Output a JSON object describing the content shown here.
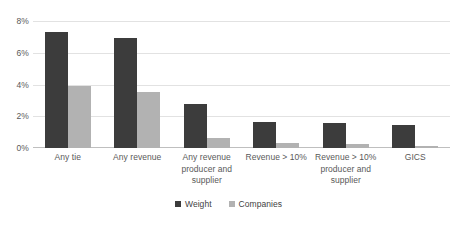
{
  "chart_data": {
    "type": "bar",
    "title": "",
    "subtitle": "",
    "xlabel": "",
    "ylabel": "",
    "grid": true,
    "legend_position": "bottom",
    "ylim": [
      0,
      8
    ],
    "ytick_values": [
      0,
      2,
      4,
      6,
      8
    ],
    "ytick_labels": [
      "0%",
      "2%",
      "4%",
      "6%",
      "8%"
    ],
    "categories": [
      "Any tie",
      "Any revenue",
      "Any revenue producer and supplier",
      "Revenue > 10%",
      "Revenue > 10% producer and supplier",
      "GICS"
    ],
    "category_lines": [
      [
        "Any tie"
      ],
      [
        "Any revenue"
      ],
      [
        "Any revenue",
        "producer and",
        "supplier"
      ],
      [
        "Revenue > 10%"
      ],
      [
        "Revenue > 10%",
        "producer and",
        "supplier"
      ],
      [
        "GICS"
      ]
    ],
    "series": [
      {
        "name": "Weight",
        "color": "#3C3C3C",
        "values": [
          7.3,
          6.9,
          2.8,
          1.65,
          1.55,
          1.45
        ]
      },
      {
        "name": "Companies",
        "color": "#B2B2B2",
        "values": [
          3.9,
          3.5,
          0.65,
          0.3,
          0.25,
          0.15
        ]
      }
    ]
  },
  "legend": {
    "items": [
      {
        "label": "Weight",
        "color": "#3C3C3C"
      },
      {
        "label": "Companies",
        "color": "#B2B2B2"
      }
    ]
  }
}
